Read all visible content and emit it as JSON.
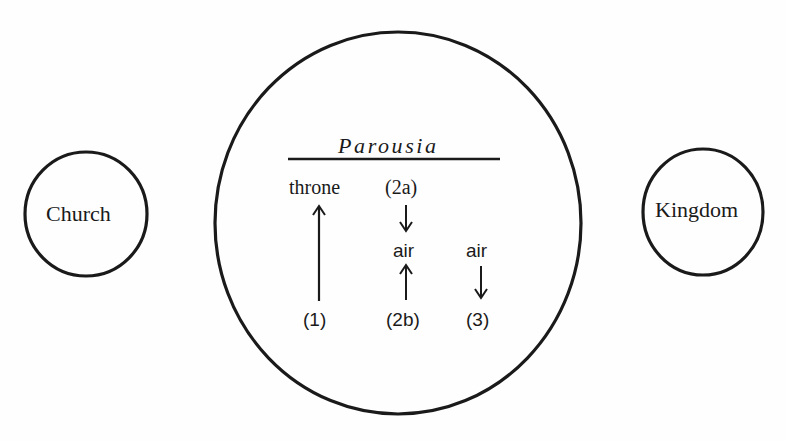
{
  "diagram": {
    "left_circle": {
      "label": "Church"
    },
    "right_circle": {
      "label": "Kingdom"
    },
    "center_ellipse": {
      "title": "Parousia",
      "nodes": {
        "throne": "throne",
        "stage_2a": "(2a)",
        "air_middle": "air",
        "air_right": "air",
        "stage_1": "(1)",
        "stage_2b": "(2b)",
        "stage_3": "(3)"
      },
      "arrows": [
        {
          "name": "stage-1-to-throne",
          "from": "(1)",
          "to": "throne",
          "direction": "up"
        },
        {
          "name": "stage-2a-to-air",
          "from": "(2a)",
          "to": "air",
          "direction": "down"
        },
        {
          "name": "stage-2b-to-air",
          "from": "(2b)",
          "to": "air",
          "direction": "up"
        },
        {
          "name": "air-to-stage-3",
          "from": "air",
          "to": "(3)",
          "direction": "down"
        }
      ]
    },
    "colors": {
      "ink": "#1a1a1a",
      "background": "#ffffff"
    }
  }
}
